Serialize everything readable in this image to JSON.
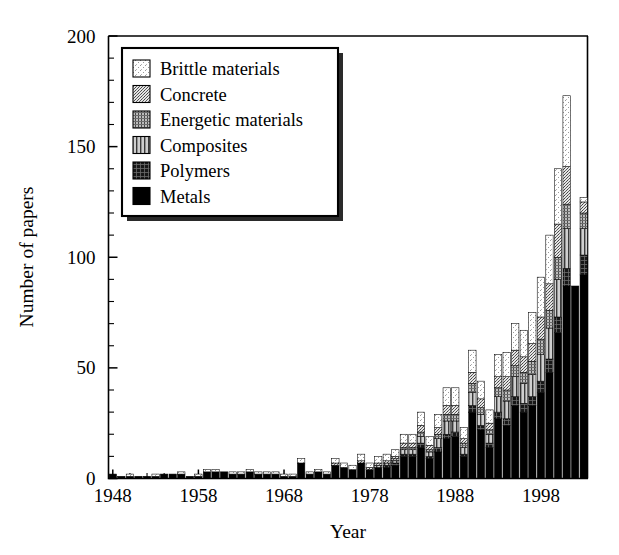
{
  "chart_data": {
    "type": "bar",
    "subtype": "stacked-bar",
    "title": "",
    "xlabel": "Year",
    "ylabel": "Number of papers",
    "xlim": [
      1947.5,
      2003.5
    ],
    "ylim": [
      0,
      200
    ],
    "ytick_major": [
      0,
      50,
      100,
      150,
      200
    ],
    "ytick_minor_step": 10,
    "xtick_major": [
      1948,
      1958,
      1968,
      1978,
      1988,
      1998
    ],
    "xtick_minor_step": 2,
    "grid": false,
    "legend_position": "upper-left-inside",
    "stack_order_bottom_to_top": [
      "Metals",
      "Polymers",
      "Composites",
      "Energetic materials",
      "Concrete",
      "Brittle materials"
    ],
    "categories": [
      1948,
      1949,
      1950,
      1951,
      1952,
      1953,
      1954,
      1955,
      1956,
      1957,
      1958,
      1959,
      1960,
      1961,
      1962,
      1963,
      1964,
      1965,
      1966,
      1967,
      1968,
      1969,
      1970,
      1971,
      1972,
      1973,
      1974,
      1975,
      1976,
      1977,
      1978,
      1979,
      1980,
      1981,
      1982,
      1983,
      1984,
      1985,
      1986,
      1987,
      1988,
      1989,
      1990,
      1991,
      1992,
      1993,
      1994,
      1995,
      1996,
      1997,
      1998,
      1999,
      2000,
      2001,
      2002,
      2003
    ],
    "series": [
      {
        "name": "Metals",
        "fill": "#000000",
        "pattern": "solid",
        "values": [
          2,
          1,
          1,
          1,
          1,
          1,
          2,
          2,
          2,
          1,
          1,
          3,
          3,
          3,
          2,
          2,
          3,
          2,
          2,
          2,
          1,
          1,
          7,
          2,
          3,
          2,
          6,
          5,
          4,
          7,
          4,
          5,
          5,
          6,
          10,
          10,
          14,
          9,
          12,
          18,
          19,
          10,
          30,
          22,
          14,
          27,
          24,
          33,
          30,
          33,
          39,
          48,
          66,
          87,
          87,
          92
        ]
      },
      {
        "name": "Polymers",
        "fill": "#1c1c1c",
        "pattern": "crosshatch-dark",
        "values": [
          0,
          0,
          0,
          0,
          0,
          0,
          0,
          0,
          0,
          0,
          0,
          0,
          0,
          0,
          0,
          0,
          0,
          0,
          0,
          0,
          0,
          0,
          0,
          0,
          0,
          0,
          0,
          0,
          0,
          0,
          0,
          0,
          1,
          1,
          1,
          1,
          2,
          1,
          2,
          2,
          2,
          1,
          3,
          2,
          2,
          3,
          3,
          4,
          4,
          4,
          5,
          6,
          7,
          8,
          0,
          9
        ]
      },
      {
        "name": "Composites",
        "fill": "#8a8a8a",
        "pattern": "vertical-lines",
        "values": [
          0,
          0,
          0,
          0,
          0,
          0,
          0,
          0,
          0,
          0,
          0,
          0,
          0,
          0,
          0,
          0,
          0,
          0,
          0,
          0,
          0,
          0,
          0,
          0,
          0,
          0,
          0,
          0,
          0,
          0,
          0,
          1,
          1,
          1,
          2,
          2,
          3,
          2,
          4,
          6,
          5,
          3,
          6,
          5,
          4,
          7,
          8,
          9,
          9,
          10,
          12,
          14,
          17,
          18,
          0,
          12
        ]
      },
      {
        "name": "Energetic materials",
        "fill": "#a9a9a9",
        "pattern": "dense-texture",
        "values": [
          0,
          0,
          0,
          0,
          0,
          0,
          0,
          0,
          0,
          0,
          0,
          0,
          0,
          0,
          0,
          0,
          0,
          0,
          0,
          0,
          0,
          0,
          0,
          0,
          0,
          0,
          0,
          0,
          0,
          0,
          0,
          0,
          0,
          1,
          1,
          1,
          2,
          1,
          2,
          3,
          3,
          2,
          4,
          3,
          2,
          4,
          5,
          5,
          5,
          6,
          7,
          8,
          10,
          11,
          0,
          7
        ]
      },
      {
        "name": "Concrete",
        "fill": "#c6c6c6",
        "pattern": "fine-dots",
        "values": [
          0,
          0,
          0,
          0,
          0,
          0,
          0,
          0,
          0,
          0,
          0,
          0,
          0,
          0,
          0,
          0,
          0,
          0,
          0,
          0,
          0,
          0,
          0,
          0,
          0,
          0,
          1,
          0,
          0,
          1,
          1,
          1,
          1,
          1,
          2,
          2,
          3,
          2,
          3,
          4,
          4,
          2,
          5,
          4,
          3,
          5,
          6,
          7,
          7,
          8,
          10,
          12,
          15,
          17,
          0,
          5
        ]
      },
      {
        "name": "Brittle materials",
        "fill": "#f2f2f2",
        "pattern": "light-speckle",
        "values": [
          0,
          0,
          1,
          0,
          0,
          1,
          0,
          0,
          1,
          0,
          1,
          1,
          1,
          0,
          1,
          1,
          1,
          1,
          1,
          1,
          1,
          1,
          2,
          1,
          1,
          1,
          2,
          2,
          2,
          3,
          2,
          3,
          3,
          3,
          4,
          4,
          6,
          4,
          6,
          8,
          8,
          5,
          10,
          8,
          6,
          10,
          11,
          12,
          12,
          14,
          18,
          22,
          25,
          32,
          0,
          2
        ]
      }
    ],
    "totals": [
      2,
      1,
      2,
      1,
      1,
      2,
      2,
      2,
      3,
      1,
      2,
      4,
      4,
      3,
      3,
      3,
      4,
      3,
      3,
      3,
      2,
      2,
      9,
      3,
      4,
      3,
      9,
      7,
      6,
      11,
      7,
      10,
      11,
      12,
      19,
      20,
      29,
      18,
      28,
      40,
      40,
      22,
      57,
      43,
      30,
      55,
      56,
      69,
      66,
      74,
      90,
      109,
      139,
      172,
      87,
      126
    ]
  },
  "axes": {
    "y_tick_labels": [
      "0",
      "50",
      "100",
      "150",
      "200"
    ],
    "x_tick_labels": [
      "1948",
      "1958",
      "1968",
      "1978",
      "1988",
      "1998"
    ],
    "y_title": "Number of papers",
    "x_title": "Year"
  },
  "legend": {
    "items": [
      {
        "label": "Brittle materials",
        "swatch": "light-speckle-swatch"
      },
      {
        "label": "Concrete",
        "swatch": "fine-dots-swatch"
      },
      {
        "label": "Energetic materials",
        "swatch": "dense-texture-swatch"
      },
      {
        "label": "Composites",
        "swatch": "vertical-lines-swatch"
      },
      {
        "label": "Polymers",
        "swatch": "crosshatch-dark-swatch"
      },
      {
        "label": "Metals",
        "swatch": "solid-black-swatch"
      }
    ]
  }
}
